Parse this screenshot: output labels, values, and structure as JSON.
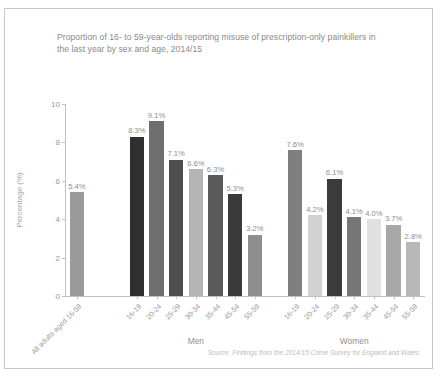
{
  "chart_data": {
    "type": "bar",
    "title": "Proportion of 16- to 59-year-olds reporting misuse of prescription-only painkillers in the last year by sex and age, 2014/15",
    "xlabel": "",
    "ylabel": "Percentage (%)",
    "ylim": [
      0,
      10
    ],
    "yticks": [
      0,
      2,
      4,
      6,
      8,
      10
    ],
    "grid": false,
    "legend": null,
    "source": "Source: Findings from the 2014/15 Crime Survey for England and Wales",
    "groups": [
      {
        "name": "",
        "label": ""
      },
      {
        "name": "men",
        "label": "Men"
      },
      {
        "name": "women",
        "label": "Women"
      }
    ],
    "categories": [
      "All adults aged 16-59",
      "16-19",
      "20-24",
      "25-29",
      "30-34",
      "35-44",
      "45-54",
      "55-59",
      "16-19",
      "20-24",
      "25-29",
      "30-34",
      "35-44",
      "45-54",
      "55-59"
    ],
    "values": [
      5.4,
      8.3,
      9.1,
      7.1,
      6.6,
      6.3,
      5.3,
      3.2,
      7.6,
      4.2,
      6.1,
      4.1,
      4.0,
      3.7,
      2.8
    ],
    "data_labels": [
      "5.4%",
      "8.3%",
      "9.1%",
      "7.1%",
      "6.6%",
      "6.3%",
      "5.3%",
      "3.2%",
      "7.6%",
      "4.2%",
      "6.1%",
      "4.1%",
      "4.0%",
      "3.7%",
      "2.8%"
    ],
    "bar_colors": [
      "#9a9a9a",
      "#2f2f2f",
      "#6e6e6e",
      "#4d4d4d",
      "#b4b4b4",
      "#5a5a5a",
      "#3a3a3a",
      "#8e8e8e",
      "#7f7f7f",
      "#d2d2d2",
      "#3b3b3b",
      "#767676",
      "#e0e0e0",
      "#a8a8a8",
      "#b8b8b8"
    ]
  },
  "colors": {
    "frame_border": "#c9c9c9",
    "title_text": "#8a8a8a",
    "axis": "#c2c2c2",
    "tick_text": "#9a9a9a",
    "source_text": "#bdbdbd"
  }
}
